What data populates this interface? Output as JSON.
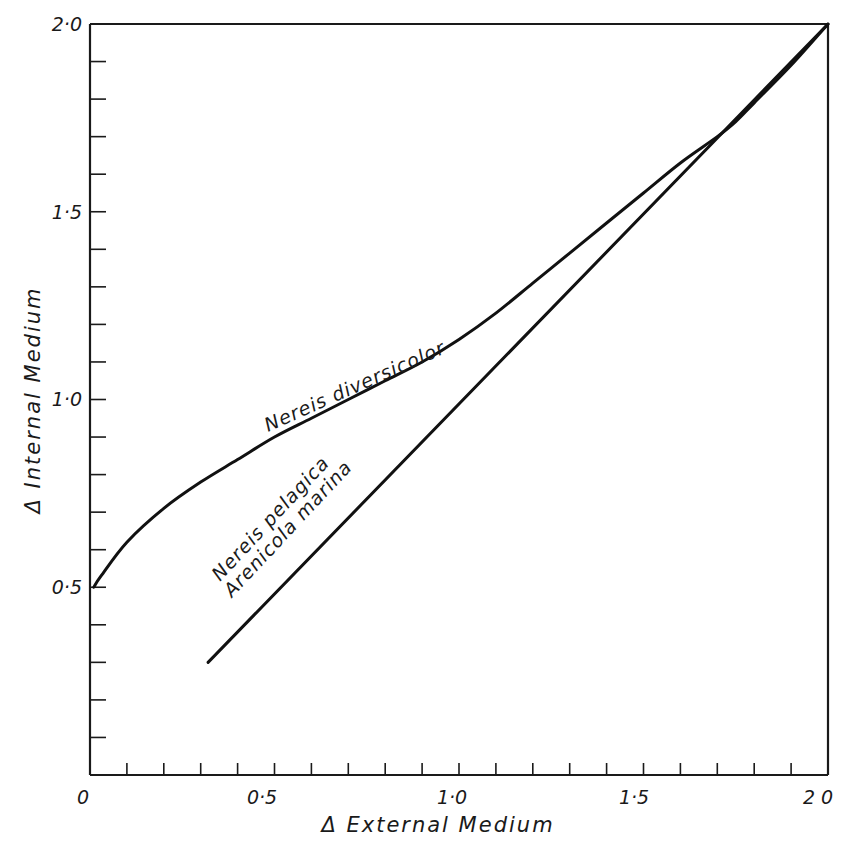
{
  "chart_data": {
    "type": "line",
    "title": "",
    "xlabel": "Δ External Medium",
    "ylabel": "Δ Internal Medium",
    "xlim": [
      0,
      2.0
    ],
    "ylim": [
      0,
      2.0
    ],
    "grid": false,
    "legend_position": "inline labels",
    "x_tick_labels": [
      "0",
      "0·5",
      "1·0",
      "1·5",
      "2 0"
    ],
    "y_tick_labels": [
      "0·5",
      "1·0",
      "1·5",
      "2·0"
    ],
    "x_minor_tick_step": 0.1,
    "y_minor_tick_step": 0.1,
    "series": [
      {
        "name": "Nereis diversicolor",
        "x": [
          0.01,
          0.03,
          0.1,
          0.2,
          0.3,
          0.4,
          0.5,
          0.6,
          0.7,
          0.8,
          0.9,
          1.0,
          1.1,
          1.2,
          1.3,
          1.4,
          1.5,
          1.6,
          1.7,
          1.75,
          1.8,
          1.9,
          2.0
        ],
        "y": [
          0.5,
          0.53,
          0.62,
          0.71,
          0.78,
          0.84,
          0.9,
          0.95,
          1.0,
          1.05,
          1.1,
          1.16,
          1.23,
          1.31,
          1.39,
          1.47,
          1.55,
          1.63,
          1.7,
          1.74,
          1.79,
          1.89,
          2.0
        ]
      },
      {
        "name": "Nereis pelagica / Arenicola marina",
        "x": [
          0.32,
          2.0
        ],
        "y": [
          0.3,
          2.0
        ]
      }
    ],
    "annotations": [
      "Nereis diversicolor",
      "Nereis pelagica",
      "Arenicola marina"
    ]
  },
  "labels": {
    "x_axis_title": "Δ  External  Medium",
    "y_axis_title": "Δ  Internal  Medium",
    "x_ticks": [
      "0",
      "0·5",
      "1·0",
      "1·5",
      "2 0"
    ],
    "y_ticks": [
      "0·5",
      "1·0",
      "1·5",
      "2·0"
    ],
    "series_1": "Nereis diversicolor",
    "series_2a": "Nereis pelagica",
    "series_2b": "Arenicola marina"
  }
}
